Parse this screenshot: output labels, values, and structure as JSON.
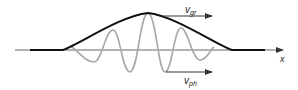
{
  "diagram": {
    "labels": {
      "group_velocity": "v",
      "group_velocity_sub": "gr",
      "phase_velocity": "v",
      "phase_velocity_sub": "ph",
      "axis": "x"
    },
    "colors": {
      "envelope": "#111111",
      "carrier_wave": "#a8a8a8",
      "axis": "#555555",
      "arrows": "#333333"
    }
  }
}
